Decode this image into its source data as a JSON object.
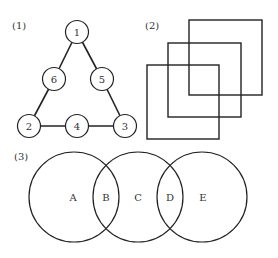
{
  "panel1": {
    "label": "(1)",
    "nodes": [
      {
        "id": "1",
        "label": "1",
        "cx": 77,
        "cy": 32
      },
      {
        "id": "6",
        "label": "6",
        "cx": 54,
        "cy": 79
      },
      {
        "id": "5",
        "label": "5",
        "cx": 102,
        "cy": 79
      },
      {
        "id": "2",
        "label": "2",
        "cx": 29,
        "cy": 126
      },
      {
        "id": "4",
        "label": "4",
        "cx": 77,
        "cy": 126
      },
      {
        "id": "3",
        "label": "3",
        "cx": 125,
        "cy": 126
      }
    ],
    "edges": [
      [
        "1",
        "6"
      ],
      [
        "6",
        "2"
      ],
      [
        "1",
        "5"
      ],
      [
        "5",
        "3"
      ],
      [
        "2",
        "4"
      ],
      [
        "4",
        "3"
      ]
    ]
  },
  "panel2": {
    "label": "(2)",
    "squares": [
      {
        "x": 189,
        "y": 20,
        "w": 73,
        "h": 75
      },
      {
        "x": 168,
        "y": 43,
        "w": 73,
        "h": 74
      },
      {
        "x": 147,
        "y": 65,
        "w": 72,
        "h": 74
      }
    ]
  },
  "panel3": {
    "label": "(3)",
    "circles": [
      {
        "cx": 74,
        "cy": 197,
        "r": 45
      },
      {
        "cx": 138,
        "cy": 197,
        "r": 45
      },
      {
        "cx": 202,
        "cy": 197,
        "r": 45
      }
    ],
    "regions": [
      {
        "label": "A",
        "x": 73,
        "y": 201
      },
      {
        "label": "B",
        "x": 106,
        "y": 201
      },
      {
        "label": "C",
        "x": 138,
        "y": 201
      },
      {
        "label": "D",
        "x": 170,
        "y": 201
      },
      {
        "label": "E",
        "x": 203,
        "y": 201
      }
    ]
  },
  "colors": {
    "stroke": "#222222",
    "text": "#333333",
    "background": "#ffffff"
  }
}
